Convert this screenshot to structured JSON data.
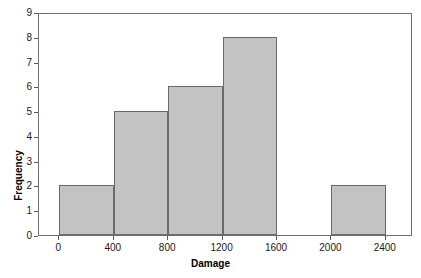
{
  "chart_data": {
    "type": "bar",
    "title": "",
    "xlabel": "Damage",
    "ylabel": "Frequency",
    "xlim": [
      -150,
      2600
    ],
    "ylim": [
      0,
      9
    ],
    "grid": false,
    "legend": null,
    "bin_width": 400,
    "xticks": [
      0,
      400,
      800,
      1200,
      1600,
      2000,
      2400
    ],
    "xtick_labels": [
      "0",
      "400",
      "800",
      "1200",
      "1600",
      "2000",
      "2400"
    ],
    "yticks": [
      0,
      1,
      2,
      3,
      4,
      5,
      6,
      7,
      8,
      9
    ],
    "ytick_labels": [
      "0",
      "1",
      "2",
      "3",
      "4",
      "5",
      "6",
      "7",
      "8",
      "9"
    ],
    "bins": [
      {
        "start": 0,
        "end": 400,
        "label": "0-400",
        "value": 2
      },
      {
        "start": 400,
        "end": 800,
        "label": "400-800",
        "value": 5
      },
      {
        "start": 800,
        "end": 1200,
        "label": "800-1200",
        "value": 6
      },
      {
        "start": 1200,
        "end": 1600,
        "label": "1200-1600",
        "value": 8
      },
      {
        "start": 1600,
        "end": 2000,
        "label": "1600-2000",
        "value": 0
      },
      {
        "start": 2000,
        "end": 2400,
        "label": "2000-2400",
        "value": 2
      }
    ],
    "categories": [
      "0-400",
      "400-800",
      "800-1200",
      "1200-1600",
      "1600-2000",
      "2000-2400"
    ],
    "values": [
      2,
      5,
      6,
      8,
      0,
      2
    ],
    "colors": {
      "bar_fill": "#c3c3c3",
      "bar_edge": "#6a6a6a",
      "frame": "#6f6f6f",
      "text": "#1a1a1a",
      "background": "#ffffff"
    }
  }
}
